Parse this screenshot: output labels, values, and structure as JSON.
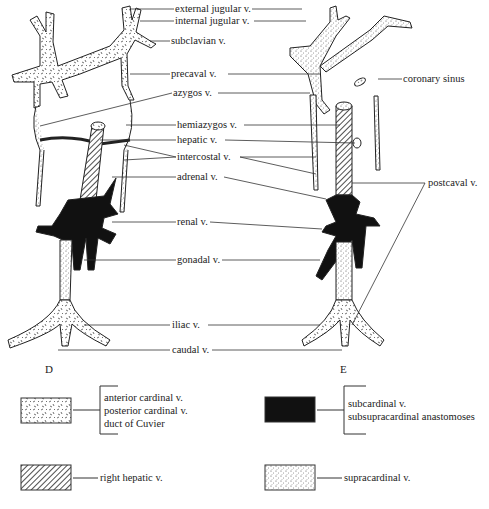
{
  "figures": [
    {
      "id": "D",
      "label": "D"
    },
    {
      "id": "E",
      "label": "E"
    }
  ],
  "labels": {
    "external_jugular": "external jugular v.",
    "internal_jugular": "internal jugular v.",
    "subclavian": "subclavian v.",
    "precaval": "precaval v.",
    "azygos": "azygos v.",
    "hemiazygos": "hemiazygos v.",
    "hepatic": "hepatic v.",
    "intercostal": "intercostal v.",
    "adrenal": "adrenal v.",
    "renal": "renal v.",
    "gonadal": "gonadal v.",
    "iliac": "iliac v.",
    "caudal": "caudal v.",
    "coronary_sinus": "coronary sinus",
    "postcaval": "postcaval v."
  },
  "legend": [
    {
      "pattern": "cardinal-texture",
      "lines": [
        "anterior cardinal v.",
        "posterior cardinal v.",
        "duct of Cuvier"
      ]
    },
    {
      "pattern": "solid-black",
      "lines": [
        "subcardinal v.",
        "subsupracardinal anastomoses"
      ]
    },
    {
      "pattern": "diagonal-hatch",
      "lines": [
        "right hepatic v."
      ]
    },
    {
      "pattern": "stipple",
      "lines": [
        "supracardinal v."
      ]
    }
  ],
  "colors": {
    "ink": "#1a1a1a",
    "paper": "#ffffff"
  }
}
